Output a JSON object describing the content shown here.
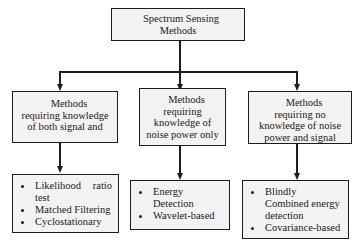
{
  "diagram": {
    "root": {
      "lines": [
        "Spectrum Sensing",
        "Methods"
      ]
    },
    "categories": [
      {
        "lines": [
          "Methods",
          "requiring knowledge",
          "of both signal and"
        ],
        "methods": [
          {
            "text_a": "Likelihood",
            "text_b": "ratio",
            "cont": "test",
            "bullet": true
          },
          {
            "text": "Matched Filtering",
            "bullet": true
          },
          {
            "text": "Cyclostationary",
            "bullet": true
          }
        ]
      },
      {
        "lines": [
          "Methods",
          "requiring",
          "knowledge of",
          "noise power only"
        ],
        "methods": [
          {
            "text": "Energy",
            "bullet": true
          },
          {
            "text": "Detection",
            "bullet": false
          },
          {
            "text": "Wavelet-based",
            "bullet": true
          }
        ]
      },
      {
        "lines": [
          "Methods",
          "requiring no",
          "knowledge of noise",
          "power and signal"
        ],
        "methods": [
          {
            "text": "Blindly",
            "bullet": true
          },
          {
            "text": "Combined energy",
            "bullet": false
          },
          {
            "text": "detection",
            "bullet": false
          },
          {
            "text": "Covariance-based",
            "bullet": true
          }
        ]
      }
    ]
  },
  "colors": {
    "box_fill": "#f3f3f3",
    "stroke": "#1e1e1e"
  }
}
